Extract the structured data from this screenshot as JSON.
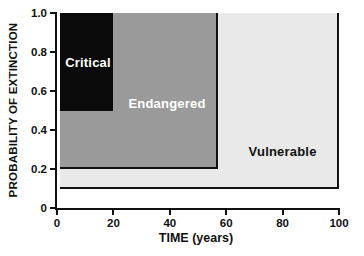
{
  "figure": {
    "background": "#ffffff",
    "axis_color": "#111111"
  },
  "chart_data": {
    "type": "area",
    "title": "",
    "xlabel": "TIME (years)",
    "ylabel": "PROBABILITY OF EXTINCTION",
    "xlim": [
      0,
      100
    ],
    "ylim": [
      0,
      1.0
    ],
    "grid": false,
    "legend": "none (labels drawn inside regions)",
    "border_color": "#111111",
    "x_ticks": [
      {
        "value": 0,
        "label": "0"
      },
      {
        "value": 20,
        "label": "20"
      },
      {
        "value": 40,
        "label": "40"
      },
      {
        "value": 60,
        "label": "60"
      },
      {
        "value": 80,
        "label": "80"
      },
      {
        "value": 100,
        "label": "100"
      }
    ],
    "y_ticks": [
      {
        "value": 0,
        "label": "0"
      },
      {
        "value": 0.2,
        "label": "0.2"
      },
      {
        "value": 0.4,
        "label": "0.4"
      },
      {
        "value": 0.6,
        "label": "0.6"
      },
      {
        "value": 0.8,
        "label": "0.8"
      },
      {
        "value": 1.0,
        "label": "1.0"
      }
    ],
    "regions": [
      {
        "name": "vulnerable",
        "label": "Vulnerable",
        "x": [
          0,
          100
        ],
        "y": [
          0.1,
          1.0
        ],
        "fill": "#e9e9e9",
        "border": true,
        "label_color": "#111111",
        "label_x": 80,
        "label_y": 0.29
      },
      {
        "name": "endangered",
        "label": "Endangered",
        "x": [
          0,
          57
        ],
        "y": [
          0.2,
          1.0
        ],
        "fill": "#9a9a9a",
        "border": true,
        "label_color": "#ffffff",
        "label_x": 39,
        "label_y": 0.54
      },
      {
        "name": "critical",
        "label": "Critical",
        "x": [
          0,
          20
        ],
        "y": [
          0.5,
          1.0
        ],
        "fill": "#0a0a0a",
        "border": false,
        "label_color": "#ffffff",
        "label_x": 11,
        "label_y": 0.75
      }
    ]
  }
}
